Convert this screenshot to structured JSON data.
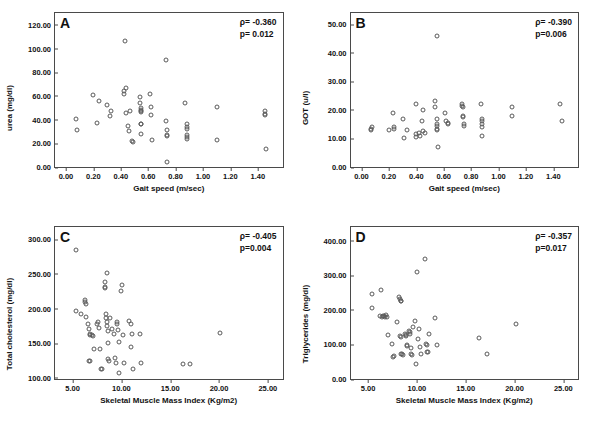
{
  "figure": {
    "title": "",
    "panels": [
      "A",
      "B",
      "C",
      "D"
    ]
  },
  "chart_data": [
    {
      "type": "scatter",
      "panel": "A",
      "title": "",
      "xlabel": "Gait speed (m/sec)",
      "ylabel": "urea (mg/dl)",
      "xlim": [
        -0.08,
        1.58
      ],
      "ylim": [
        0,
        130
      ],
      "xticks": [
        "0.00",
        "0.20",
        "0.40",
        "0.60",
        "0.80",
        "1.00",
        "1.20",
        "1.40"
      ],
      "xtickvals": [
        0.0,
        0.2,
        0.4,
        0.6,
        0.8,
        1.0,
        1.2,
        1.4
      ],
      "yticks": [
        "0.00",
        "20.00",
        "40.00",
        "60.00",
        "80.00",
        "100.00",
        "120.00"
      ],
      "ytickvals": [
        0,
        20,
        40,
        60,
        80,
        100,
        120
      ],
      "grid": false,
      "annotations": {
        "rho": "ρ= -0.360",
        "p": "p= 0.012"
      },
      "rho": -0.36,
      "p_value": 0.012,
      "points": [
        [
          0.07,
          40.5
        ],
        [
          0.08,
          31.0
        ],
        [
          0.2,
          61.0
        ],
        [
          0.23,
          37.0
        ],
        [
          0.24,
          56.0
        ],
        [
          0.3,
          52.0
        ],
        [
          0.32,
          43.0
        ],
        [
          0.33,
          47.0
        ],
        [
          0.42,
          64.0
        ],
        [
          0.42,
          61.5
        ],
        [
          0.43,
          106.0
        ],
        [
          0.44,
          67.0
        ],
        [
          0.44,
          46.0
        ],
        [
          0.45,
          34.5
        ],
        [
          0.46,
          30.0
        ],
        [
          0.47,
          47.0
        ],
        [
          0.48,
          22.0
        ],
        [
          0.49,
          21.5
        ],
        [
          0.54,
          59.5
        ],
        [
          0.54,
          54.0
        ],
        [
          0.55,
          50.0
        ],
        [
          0.55,
          48.0
        ],
        [
          0.55,
          47.0
        ],
        [
          0.55,
          46.5
        ],
        [
          0.55,
          36.5
        ],
        [
          0.55,
          36.0
        ],
        [
          0.55,
          28.0
        ],
        [
          0.61,
          62.0
        ],
        [
          0.62,
          51.0
        ],
        [
          0.62,
          44.0
        ],
        [
          0.63,
          23.0
        ],
        [
          0.73,
          90.0
        ],
        [
          0.73,
          39.0
        ],
        [
          0.74,
          31.0
        ],
        [
          0.74,
          27.0
        ],
        [
          0.74,
          26.5
        ],
        [
          0.74,
          4.5
        ],
        [
          0.87,
          54.0
        ],
        [
          0.88,
          36.0
        ],
        [
          0.88,
          34.0
        ],
        [
          0.88,
          32.5
        ],
        [
          0.88,
          27.0
        ],
        [
          0.88,
          25.0
        ],
        [
          0.88,
          24.0
        ],
        [
          1.1,
          50.5
        ],
        [
          1.1,
          23.0
        ],
        [
          1.45,
          47.0
        ],
        [
          1.45,
          45.0
        ],
        [
          1.45,
          44.0
        ],
        [
          1.46,
          15.5
        ]
      ]
    },
    {
      "type": "scatter",
      "panel": "B",
      "title": "",
      "xlabel": "Gait speed (m/sec)",
      "ylabel": "GOT (u/l)",
      "xlim": [
        -0.08,
        1.58
      ],
      "ylim": [
        0,
        54
      ],
      "xticks": [
        "0.00",
        "0.20",
        "0.40",
        "0.60",
        "0.80",
        "1.00",
        "1.20",
        "1.40"
      ],
      "xtickvals": [
        0.0,
        0.2,
        0.4,
        0.6,
        0.8,
        1.0,
        1.2,
        1.4
      ],
      "yticks": [
        "0.00",
        "10.00",
        "20.00",
        "30.00",
        "40.00",
        "50.00"
      ],
      "ytickvals": [
        0,
        10,
        20,
        30,
        40,
        50
      ],
      "grid": false,
      "annotations": {
        "rho": "ρ= -0.390",
        "p": "p=0.006"
      },
      "rho": -0.39,
      "p_value": 0.006,
      "points": [
        [
          0.07,
          13.5
        ],
        [
          0.07,
          13.0
        ],
        [
          0.08,
          14.0
        ],
        [
          0.2,
          13.0
        ],
        [
          0.23,
          19.0
        ],
        [
          0.24,
          14.0
        ],
        [
          0.24,
          13.5
        ],
        [
          0.3,
          17.0
        ],
        [
          0.31,
          10.0
        ],
        [
          0.33,
          13.0
        ],
        [
          0.4,
          22.0
        ],
        [
          0.4,
          11.5
        ],
        [
          0.4,
          10.5
        ],
        [
          0.42,
          12.0
        ],
        [
          0.43,
          11.0
        ],
        [
          0.44,
          16.0
        ],
        [
          0.45,
          20.0
        ],
        [
          0.45,
          12.5
        ],
        [
          0.46,
          12.0
        ],
        [
          0.54,
          23.0
        ],
        [
          0.54,
          21.0
        ],
        [
          0.55,
          46.0
        ],
        [
          0.55,
          17.0
        ],
        [
          0.55,
          15.0
        ],
        [
          0.55,
          14.5
        ],
        [
          0.55,
          13.5
        ],
        [
          0.55,
          13.0
        ],
        [
          0.56,
          7.0
        ],
        [
          0.61,
          19.0
        ],
        [
          0.62,
          16.0
        ],
        [
          0.63,
          15.5
        ],
        [
          0.63,
          15.0
        ],
        [
          0.73,
          22.0
        ],
        [
          0.73,
          21.5
        ],
        [
          0.74,
          21.0
        ],
        [
          0.74,
          18.0
        ],
        [
          0.74,
          17.5
        ],
        [
          0.75,
          15.0
        ],
        [
          0.75,
          14.5
        ],
        [
          0.87,
          22.0
        ],
        [
          0.88,
          17.0
        ],
        [
          0.88,
          16.0
        ],
        [
          0.88,
          15.0
        ],
        [
          0.88,
          14.0
        ],
        [
          0.88,
          11.0
        ],
        [
          1.1,
          21.0
        ],
        [
          1.1,
          18.0
        ],
        [
          1.45,
          22.0
        ],
        [
          1.46,
          16.0
        ]
      ]
    },
    {
      "type": "scatter",
      "panel": "C",
      "title": "",
      "xlabel": "Skeletal Muscle Mass Index (Kg/m2)",
      "ylabel": "Total cholesterol (mg/dl)",
      "xlim": [
        3.2,
        26.5
      ],
      "ylim": [
        98,
        318
      ],
      "xticks": [
        "5.00",
        "10.00",
        "15.00",
        "20.00",
        "25.00"
      ],
      "xtickvals": [
        5,
        10,
        15,
        20,
        25
      ],
      "yticks": [
        "100.00",
        "150.00",
        "200.00",
        "250.00",
        "300.00"
      ],
      "ytickvals": [
        100,
        150,
        200,
        250,
        300
      ],
      "grid": false,
      "annotations": {
        "rho": "ρ= -0.405",
        "p": "p=0.004"
      },
      "rho": -0.405,
      "p_value": 0.004,
      "points": [
        [
          5.4,
          285.0
        ],
        [
          5.3,
          197.0
        ],
        [
          5.9,
          192.0
        ],
        [
          6.3,
          213.0
        ],
        [
          6.3,
          210.0
        ],
        [
          6.4,
          207.0
        ],
        [
          6.4,
          188.0
        ],
        [
          6.6,
          178.0
        ],
        [
          6.7,
          170.0
        ],
        [
          6.8,
          163.0
        ],
        [
          6.8,
          161.0
        ],
        [
          6.7,
          124.0
        ],
        [
          6.8,
          123.5
        ],
        [
          7.0,
          161.0
        ],
        [
          7.1,
          160.0
        ],
        [
          7.2,
          142.0
        ],
        [
          7.5,
          178.0
        ],
        [
          7.6,
          180.0
        ],
        [
          7.7,
          172.0
        ],
        [
          7.8,
          141.0
        ],
        [
          7.9,
          112.0
        ],
        [
          8.0,
          112.5
        ],
        [
          8.3,
          239.0
        ],
        [
          8.3,
          231.0
        ],
        [
          8.3,
          230.0
        ],
        [
          8.4,
          192.0
        ],
        [
          8.4,
          186.0
        ],
        [
          8.5,
          251.0
        ],
        [
          8.5,
          180.0
        ],
        [
          8.5,
          175.0
        ],
        [
          8.6,
          167.0
        ],
        [
          8.6,
          150.0
        ],
        [
          8.6,
          127.0
        ],
        [
          8.7,
          124.0
        ],
        [
          8.8,
          186.0
        ],
        [
          9.0,
          171.0
        ],
        [
          9.2,
          163.0
        ],
        [
          9.3,
          128.0
        ],
        [
          9.4,
          121.0
        ],
        [
          9.5,
          180.0
        ],
        [
          9.6,
          178.0
        ],
        [
          9.7,
          169.0
        ],
        [
          9.8,
          151.0
        ],
        [
          9.8,
          107.0
        ],
        [
          10.0,
          225.0
        ],
        [
          10.1,
          234.0
        ],
        [
          10.2,
          162.0
        ],
        [
          10.3,
          121.0
        ],
        [
          10.8,
          182.0
        ],
        [
          11.0,
          178.0
        ],
        [
          11.0,
          145.0
        ],
        [
          11.1,
          163.0
        ],
        [
          11.2,
          113.0
        ],
        [
          11.9,
          163.0
        ],
        [
          12.0,
          121.0
        ],
        [
          16.3,
          119.0
        ],
        [
          17.0,
          119.5
        ],
        [
          20.1,
          165.0
        ]
      ]
    },
    {
      "type": "scatter",
      "panel": "D",
      "title": "",
      "xlabel": "Skeletal Muscle Mass Index (Kg/m2)",
      "ylabel": "Triglycerides (mg/dl)",
      "xlim": [
        3.2,
        26.5
      ],
      "ylim": [
        0,
        440
      ],
      "xticks": [
        "5.00",
        "10.00",
        "15.00",
        "20.00",
        "25.00"
      ],
      "xtickvals": [
        5,
        10,
        15,
        20,
        25
      ],
      "yticks": [
        "0.00",
        "100.00",
        "200.00",
        "300.00",
        "400.00"
      ],
      "ytickvals": [
        0,
        100,
        200,
        300,
        400
      ],
      "grid": false,
      "annotations": {
        "rho": "ρ= -0.357",
        "p": "p=0.017"
      },
      "rho": -0.357,
      "p_value": 0.017,
      "points": [
        [
          5.4,
          247.0
        ],
        [
          5.4,
          205.0
        ],
        [
          6.3,
          259.0
        ],
        [
          6.2,
          183.0
        ],
        [
          6.4,
          180.0
        ],
        [
          6.5,
          182.0
        ],
        [
          6.6,
          181.0
        ],
        [
          6.7,
          180.0
        ],
        [
          6.8,
          184.0
        ],
        [
          6.9,
          180.0
        ],
        [
          7.0,
          127.0
        ],
        [
          7.4,
          101.0
        ],
        [
          7.6,
          64.0
        ],
        [
          7.7,
          68.0
        ],
        [
          8.0,
          166.0
        ],
        [
          8.2,
          237.0
        ],
        [
          8.3,
          233.0
        ],
        [
          8.4,
          227.0
        ],
        [
          8.4,
          226.0
        ],
        [
          8.3,
          124.0
        ],
        [
          8.4,
          121.0
        ],
        [
          8.4,
          73.0
        ],
        [
          8.5,
          71.0
        ],
        [
          8.6,
          70.0
        ],
        [
          8.8,
          131.0
        ],
        [
          8.9,
          128.0
        ],
        [
          8.9,
          125.0
        ],
        [
          9.0,
          98.0
        ],
        [
          9.0,
          95.0
        ],
        [
          9.2,
          140.0
        ],
        [
          9.3,
          136.0
        ],
        [
          9.3,
          130.0
        ],
        [
          9.4,
          90.0
        ],
        [
          9.4,
          71.0
        ],
        [
          9.5,
          69.0
        ],
        [
          9.6,
          151.0
        ],
        [
          9.8,
          168.0
        ],
        [
          9.9,
          44.0
        ],
        [
          10.0,
          310.0
        ],
        [
          10.1,
          115.0
        ],
        [
          10.2,
          146.0
        ],
        [
          10.3,
          94.0
        ],
        [
          10.4,
          73.0
        ],
        [
          10.8,
          348.0
        ],
        [
          10.9,
          101.0
        ],
        [
          11.0,
          98.0
        ],
        [
          11.0,
          78.0
        ],
        [
          11.1,
          77.0
        ],
        [
          11.2,
          129.0
        ],
        [
          11.9,
          178.0
        ],
        [
          12.1,
          98.0
        ],
        [
          16.4,
          120.0
        ],
        [
          17.2,
          71.0
        ],
        [
          20.1,
          158.0
        ]
      ]
    }
  ]
}
